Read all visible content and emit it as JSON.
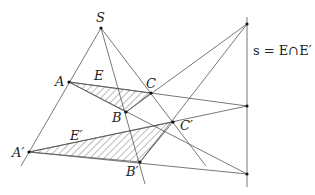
{
  "diagram": {
    "labels": {
      "S": "S",
      "A": "A",
      "B": "B",
      "C": "C",
      "E": "E",
      "A_prime": "A′",
      "B_prime": "B′",
      "C_prime": "C′",
      "E_prime": "E′",
      "axis": "s = E∩E′"
    },
    "points": {
      "S": [
        101,
        28
      ],
      "A": [
        69,
        82
      ],
      "B": [
        126,
        112
      ],
      "C": [
        151,
        93
      ],
      "A_prime": [
        29,
        152
      ],
      "B_prime": [
        140,
        162
      ],
      "C_prime": [
        173,
        122
      ],
      "P_top": [
        247,
        24
      ],
      "P_AC": [
        247,
        106
      ],
      "P_AB": [
        247,
        174
      ]
    },
    "colors": {
      "line": "#555555",
      "point": "#111111",
      "text": "#222222"
    }
  }
}
